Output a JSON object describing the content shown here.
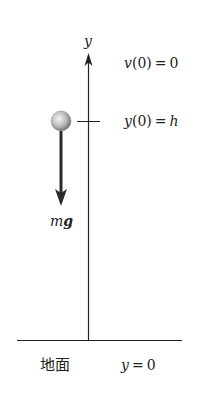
{
  "diagram": {
    "axis": {
      "label": "y"
    },
    "initial_velocity": {
      "func": "v",
      "arg": "(0)",
      "eq": "=",
      "value": "0"
    },
    "initial_position": {
      "func": "y",
      "arg": "(0)",
      "eq": "=",
      "value": "h"
    },
    "force": {
      "mass": "m",
      "gravity": "g"
    },
    "ground": {
      "label": "地面",
      "var": "y",
      "eq": "=",
      "value": "0"
    },
    "colors": {
      "line": "#222222",
      "ball_light": "#f2f2f2",
      "ball_dark": "#6a6a6a",
      "arrow": "#2a2a2a"
    }
  }
}
